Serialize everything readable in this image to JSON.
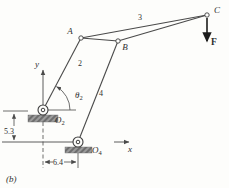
{
  "figure_label": "(b)",
  "labels": {
    "joint_a": "A",
    "joint_b": "B",
    "joint_c": "C",
    "link_2": "2",
    "link_3": "3",
    "link_4": "4",
    "pivot_o2": {
      "main": "O",
      "sub": "2"
    },
    "pivot_o4": {
      "main": "O",
      "sub": "4"
    },
    "angle_theta2": {
      "main": "θ",
      "sub": "2"
    },
    "axis_x": "x",
    "axis_y": "y",
    "force": "F",
    "dim_vertical": "5.3",
    "dim_horizontal": "6.4"
  },
  "colors": {
    "line": "#4a4a4a",
    "text": "#2f2f2f",
    "ground_fill": "#9b9b9b",
    "ground_hatch": "#5a5a5a",
    "background": "#fdfdfb",
    "force_arrow": "#1c1c1c"
  },
  "diagram": {
    "type": "four-bar linkage with coupler point",
    "ground_pivots": [
      "O2",
      "O4"
    ],
    "joints": [
      "A",
      "B",
      "C"
    ],
    "links": [
      {
        "number": "2",
        "connects": [
          "O2",
          "A"
        ]
      },
      {
        "number": "3",
        "connects": [
          "A",
          "B",
          "C"
        ],
        "shape": "triangular coupler"
      },
      {
        "number": "4",
        "connects": [
          "O4",
          "B"
        ]
      }
    ],
    "force": {
      "symbol": "F",
      "applied_at": "C",
      "direction": "down"
    },
    "input_angle": {
      "symbol": "θ2",
      "at": "O2",
      "from": "horizontal reference",
      "to": "link 2"
    },
    "dimensions": [
      {
        "value": "5.3",
        "between": "O2 level and x-axis (vertical)"
      },
      {
        "value": "6.4",
        "between": "y-axis and O4 (horizontal)"
      }
    ]
  }
}
